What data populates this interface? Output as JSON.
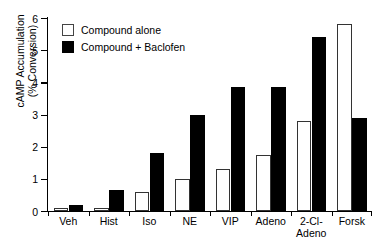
{
  "chart_data": {
    "type": "bar",
    "title": "",
    "xlabel": "",
    "ylabel": "cAMP Accumulation (% Conversion)",
    "ylabel_lines": [
      "cAMP Accumulation",
      "(% Conversion)"
    ],
    "ylim": [
      0,
      6
    ],
    "yticks": [
      0,
      1,
      2,
      3,
      4,
      5,
      6
    ],
    "ytick_labels": [
      "0",
      "1",
      "2",
      "3",
      "4",
      "5",
      "6"
    ],
    "grid": false,
    "legend_position": "top-left",
    "categories": [
      "Veh",
      "Hist",
      "Iso",
      "NE",
      "VIP",
      "Adeno",
      "2-Cl-Adeno",
      "Forsk"
    ],
    "category_lines": [
      [
        "Veh"
      ],
      [
        "Hist"
      ],
      [
        "Iso"
      ],
      [
        "NE"
      ],
      [
        "VIP"
      ],
      [
        "Adeno"
      ],
      [
        "2-Cl-",
        "Adeno"
      ],
      [
        "Forsk"
      ]
    ],
    "series": [
      {
        "name": "Compound alone",
        "color": "#ffffff",
        "edge_color": "#333333",
        "values": [
          0.1,
          0.1,
          0.6,
          1.0,
          1.3,
          1.75,
          2.8,
          5.8
        ]
      },
      {
        "name": "Compound + Baclofen",
        "color": "#000000",
        "edge_color": "#000000",
        "values": [
          0.2,
          0.65,
          1.8,
          3.0,
          3.85,
          3.85,
          5.4,
          2.9
        ]
      }
    ]
  },
  "legend": {
    "items": [
      {
        "label": "Compound alone",
        "style": "white"
      },
      {
        "label": "Compound + Baclofen",
        "style": "black"
      }
    ]
  }
}
